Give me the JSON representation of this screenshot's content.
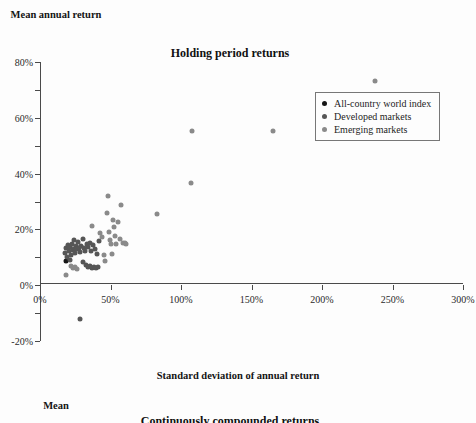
{
  "figure": {
    "title": "Holding period returns",
    "y_axis_title": "Mean annual return",
    "x_axis_title": "Standard deviation of annual return"
  },
  "next_figure": {
    "y_axis_title": "Mean",
    "title": "Continuously compounded returns"
  },
  "legend": {
    "items": [
      {
        "label": "All-country world index",
        "color": "#151515"
      },
      {
        "label": "Developed markets",
        "color": "#565656"
      },
      {
        "label": "Emerging markets",
        "color": "#8a8a8a"
      }
    ]
  },
  "chart_data": {
    "type": "scatter",
    "title": "Holding period returns",
    "xlabel": "Standard deviation of annual return",
    "ylabel": "Mean annual return",
    "xlim": [
      0,
      300
    ],
    "ylim": [
      -20,
      80
    ],
    "x_tick_labels": [
      "0%",
      "50%",
      "100%",
      "150%",
      "200%",
      "250%",
      "300%"
    ],
    "x_ticks": [
      0,
      50,
      100,
      150,
      200,
      250,
      300
    ],
    "x_minor_ticks": [
      25,
      75,
      125,
      175,
      225,
      275
    ],
    "y_tick_labels": [
      "80%",
      "60%",
      "40%",
      "20%",
      "0%",
      "-20%"
    ],
    "y_ticks": [
      80,
      60,
      40,
      20,
      0,
      -20
    ],
    "y_minor_ticks": [
      70,
      50,
      30,
      10,
      -10
    ],
    "grid": false,
    "legend_position": "upper right",
    "series": [
      {
        "name": "All-country world index",
        "color": "#151515",
        "points": [
          [
            18.5,
            8.6
          ]
        ]
      },
      {
        "name": "Developed markets",
        "color": "#565656",
        "points": [
          [
            17.4,
            11.7
          ],
          [
            18.2,
            13.3
          ],
          [
            19.4,
            10.2
          ],
          [
            20.1,
            14.4
          ],
          [
            20.6,
            12.2
          ],
          [
            21.0,
            9.1
          ],
          [
            21.6,
            13.6
          ],
          [
            22.3,
            11.0
          ],
          [
            22.8,
            14.9
          ],
          [
            23.2,
            12.7
          ],
          [
            23.9,
            16.1
          ],
          [
            24.4,
            13.1
          ],
          [
            25.1,
            11.5
          ],
          [
            25.8,
            14.2
          ],
          [
            26.4,
            12.9
          ],
          [
            27.0,
            15.4
          ],
          [
            27.9,
            13.5
          ],
          [
            28.6,
            11.9
          ],
          [
            29.4,
            14.0
          ],
          [
            30.2,
            16.5
          ],
          [
            31.0,
            13.2
          ],
          [
            32.1,
            12.4
          ],
          [
            33.0,
            14.7
          ],
          [
            34.2,
            13.8
          ],
          [
            35.4,
            15.2
          ],
          [
            36.3,
            12.1
          ],
          [
            37.5,
            14.3
          ],
          [
            38.9,
            13.0
          ],
          [
            40.2,
            11.3
          ],
          [
            41.6,
            15.8
          ],
          [
            30.4,
            8.4
          ],
          [
            32.5,
            7.1
          ],
          [
            34.0,
            6.4
          ],
          [
            35.6,
            6.8
          ],
          [
            37.2,
            6.1
          ],
          [
            38.4,
            6.6
          ],
          [
            40.0,
            6.2
          ],
          [
            41.4,
            6.5
          ],
          [
            28.5,
            -12.0
          ]
        ]
      },
      {
        "name": "Emerging markets",
        "color": "#8a8a8a",
        "points": [
          [
            18.3,
            3.6
          ],
          [
            22.0,
            6.9
          ],
          [
            23.6,
            6.2
          ],
          [
            25.0,
            6.6
          ],
          [
            26.4,
            5.9
          ],
          [
            36.8,
            21.3
          ],
          [
            42.6,
            18.6
          ],
          [
            44.2,
            17.3
          ],
          [
            45.4,
            11.0
          ],
          [
            46.0,
            8.8
          ],
          [
            47.2,
            25.8
          ],
          [
            48.0,
            31.8
          ],
          [
            48.6,
            19.2
          ],
          [
            49.4,
            16.3
          ],
          [
            50.1,
            14.8
          ],
          [
            50.8,
            11.2
          ],
          [
            52.0,
            23.2
          ],
          [
            52.6,
            21.0
          ],
          [
            53.4,
            17.6
          ],
          [
            54.2,
            14.6
          ],
          [
            55.0,
            22.5
          ],
          [
            56.4,
            16.7
          ],
          [
            57.8,
            28.6
          ],
          [
            58.6,
            15.2
          ],
          [
            60.4,
            15.0
          ],
          [
            61.2,
            14.8
          ],
          [
            83.0,
            25.4
          ],
          [
            107.0,
            36.6
          ],
          [
            107.5,
            55.4
          ],
          [
            165.0,
            55.2
          ],
          [
            237.5,
            73.2
          ]
        ]
      }
    ]
  }
}
